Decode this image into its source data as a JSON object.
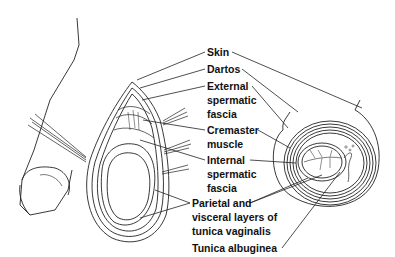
{
  "figure": {
    "labels": [
      {
        "id": "skin",
        "text": "Skin",
        "x": 207,
        "y": 46
      },
      {
        "id": "dartos",
        "text": "Dartos",
        "x": 207,
        "y": 63
      },
      {
        "id": "external-spermatic-fascia-1",
        "text": "External",
        "x": 207,
        "y": 80
      },
      {
        "id": "external-spermatic-fascia-2",
        "text": "spermatic",
        "x": 207,
        "y": 94
      },
      {
        "id": "external-spermatic-fascia-3",
        "text": "fascia",
        "x": 207,
        "y": 108
      },
      {
        "id": "cremaster-1",
        "text": "Cremaster",
        "x": 207,
        "y": 124
      },
      {
        "id": "cremaster-2",
        "text": "muscle",
        "x": 207,
        "y": 138
      },
      {
        "id": "internal-spermatic-fascia-1",
        "text": "Internal",
        "x": 207,
        "y": 154
      },
      {
        "id": "internal-spermatic-fascia-2",
        "text": "spermatic",
        "x": 207,
        "y": 168
      },
      {
        "id": "internal-spermatic-fascia-3",
        "text": "fascia",
        "x": 207,
        "y": 182
      },
      {
        "id": "tunica-vaginalis-1",
        "text": "Parietal and",
        "x": 192,
        "y": 197
      },
      {
        "id": "tunica-vaginalis-2",
        "text": "visceral layers of",
        "x": 192,
        "y": 211
      },
      {
        "id": "tunica-vaginalis-3",
        "text": "tunica vaginalis",
        "x": 192,
        "y": 225
      },
      {
        "id": "tunica-albuginea",
        "text": "Tunica albuginea",
        "x": 192,
        "y": 242
      }
    ]
  }
}
